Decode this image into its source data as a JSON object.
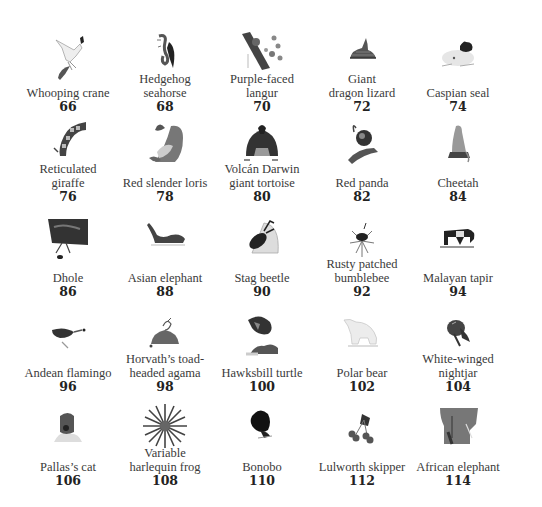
{
  "gallery": {
    "items": [
      {
        "name": "Whooping crane",
        "number": "66",
        "icon": "whooping-crane-image"
      },
      {
        "name": "Hedgehog\nseahorse",
        "number": "68",
        "icon": "hedgehog-seahorse-image"
      },
      {
        "name": "Purple-faced\nlangur",
        "number": "70",
        "icon": "purple-faced-langur-image"
      },
      {
        "name": "Giant\ndragon lizard",
        "number": "72",
        "icon": "giant-dragon-lizard-image"
      },
      {
        "name": "Caspian seal",
        "number": "74",
        "icon": "caspian-seal-image"
      },
      {
        "name": "Reticulated\ngiraffe",
        "number": "76",
        "icon": "reticulated-giraffe-image"
      },
      {
        "name": "Red slender loris",
        "number": "78",
        "icon": "red-slender-loris-image"
      },
      {
        "name": "Volcán Darwin\ngiant tortoise",
        "number": "80",
        "icon": "giant-tortoise-image"
      },
      {
        "name": "Red panda",
        "number": "82",
        "icon": "red-panda-image"
      },
      {
        "name": "Cheetah",
        "number": "84",
        "icon": "cheetah-image"
      },
      {
        "name": "Dhole",
        "number": "86",
        "icon": "dhole-image"
      },
      {
        "name": "Asian elephant",
        "number": "88",
        "icon": "asian-elephant-image"
      },
      {
        "name": "Stag beetle",
        "number": "90",
        "icon": "stag-beetle-image"
      },
      {
        "name": "Rusty patched\nbumblebee",
        "number": "92",
        "icon": "bumblebee-image"
      },
      {
        "name": "Malayan tapir",
        "number": "94",
        "icon": "malayan-tapir-image"
      },
      {
        "name": "Andean flamingo",
        "number": "96",
        "icon": "andean-flamingo-image"
      },
      {
        "name": "Horvath’s toad-\nheaded agama",
        "number": "98",
        "icon": "toad-headed-agama-image"
      },
      {
        "name": "Hawksbill turtle",
        "number": "100",
        "icon": "hawksbill-turtle-image"
      },
      {
        "name": "Polar bear",
        "number": "102",
        "icon": "polar-bear-image"
      },
      {
        "name": "White-winged\nnightjar",
        "number": "104",
        "icon": "white-winged-nightjar-image"
      },
      {
        "name": "Pallas’s cat",
        "number": "106",
        "icon": "pallas-cat-image"
      },
      {
        "name": "Variable\nharlequin frog",
        "number": "108",
        "icon": "harlequin-frog-image"
      },
      {
        "name": "Bonobo",
        "number": "110",
        "icon": "bonobo-image"
      },
      {
        "name": "Lulworth skipper",
        "number": "112",
        "icon": "lulworth-skipper-image"
      },
      {
        "name": "African elephant",
        "number": "114",
        "icon": "african-elephant-image"
      }
    ]
  }
}
